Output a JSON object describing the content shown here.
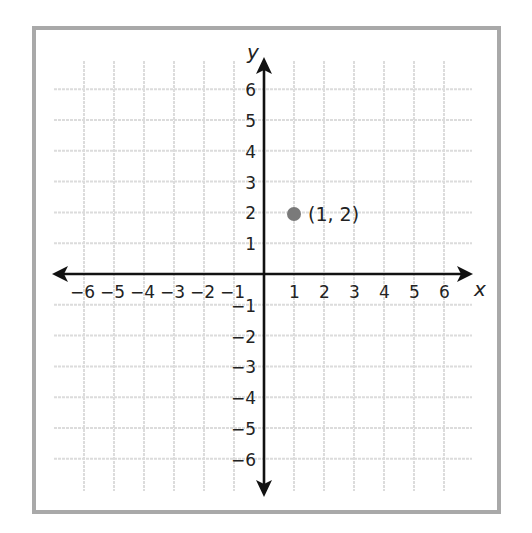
{
  "chart_data": {
    "type": "scatter",
    "title": "",
    "xlabel": "x",
    "ylabel": "y",
    "xlim": [
      -6,
      6
    ],
    "ylim": [
      -6,
      6
    ],
    "grid": true,
    "x_ticks": [
      "−6",
      "−5",
      "−4",
      "−3",
      "−2",
      "−1",
      "1",
      "2",
      "3",
      "4",
      "5",
      "6"
    ],
    "y_ticks": [
      "6",
      "5",
      "4",
      "3",
      "2",
      "1",
      "−1",
      "−2",
      "−3",
      "−4",
      "−5",
      "−6"
    ],
    "series": [
      {
        "name": "point",
        "points": [
          {
            "x": 1,
            "y": 2,
            "label": "(1, 2)"
          }
        ]
      }
    ]
  },
  "labels": {
    "x_axis": "x",
    "y_axis": "y",
    "point": "(1, 2)"
  },
  "colors": {
    "frame": "#a9a9a9",
    "grid": "#dcdcdc",
    "axis": "#111111",
    "point": "#7a7a7a"
  }
}
